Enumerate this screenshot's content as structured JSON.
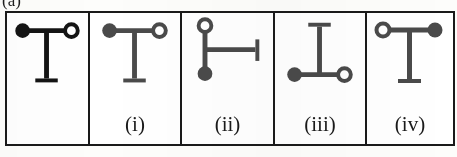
{
  "figure": {
    "caption_partial": "(a)",
    "type": "multiple-choice-shape-options",
    "stroke_dark": "#1a1a1a",
    "stroke_gray": "#4a4a4a",
    "background": "#ffffff"
  },
  "panels": [
    {
      "key": "reference",
      "label": "",
      "shape_name": "tee-down",
      "description": "T shape: horizontal bar on top with filled circle at left end and open circle at right end, vertical stem descending from centre ending in a short horizontal foot",
      "color": "#141414",
      "left_endpoint": "filled-circle",
      "right_endpoint": "open-circle",
      "stem_direction": "down",
      "stem_foot": "horizontal"
    },
    {
      "key": "i",
      "label": "(i)",
      "shape_name": "tee-down",
      "description": "T shape: horizontal bar on top with filled circle at left end and open circle at right end, vertical stem descending from centre ending in a short horizontal foot",
      "color": "#4a4a4a",
      "left_endpoint": "filled-circle",
      "right_endpoint": "open-circle",
      "stem_direction": "down",
      "stem_foot": "horizontal"
    },
    {
      "key": "ii",
      "label": "(ii)",
      "shape_name": "tee-right",
      "description": "T rotated 90 degrees: vertical bar with open circle at top end and filled circle at bottom end, horizontal arm extending right from centre ending in a short vertical cap",
      "color": "#4a4a4a",
      "top_endpoint": "open-circle",
      "bottom_endpoint": "filled-circle",
      "stem_direction": "right",
      "stem_foot": "vertical"
    },
    {
      "key": "iii",
      "label": "(iii)",
      "shape_name": "tee-up",
      "description": "Inverted T: horizontal bar at the bottom with filled circle at left end and open circle at right end, vertical stem rising from centre ending in a short horizontal cap",
      "color": "#4a4a4a",
      "left_endpoint": "filled-circle",
      "right_endpoint": "open-circle",
      "stem_direction": "up",
      "stem_foot": "horizontal"
    },
    {
      "key": "iv",
      "label": "(iv)",
      "shape_name": "tee-down-mirrored",
      "description": "T shape mirrored: horizontal bar on top with open circle at left end and filled circle at right end, vertical stem descending from centre ending in a short horizontal foot",
      "color": "#4a4a4a",
      "left_endpoint": "open-circle",
      "right_endpoint": "filled-circle",
      "stem_direction": "down",
      "stem_foot": "horizontal"
    }
  ]
}
